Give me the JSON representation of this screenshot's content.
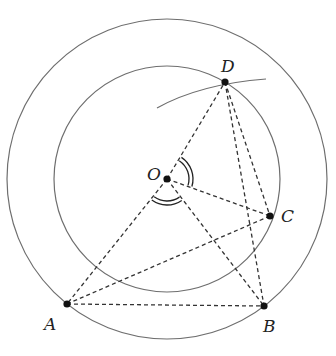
{
  "diagram": {
    "type": "geometry",
    "colors": {
      "circle_stroke": "#6e6e6e",
      "dashed_stroke": "#333333",
      "point_fill": "#111111",
      "label_color": "#222222",
      "background": "#ffffff"
    },
    "center": {
      "label": "O",
      "x": 167,
      "y": 179
    },
    "circles": [
      {
        "name": "outer",
        "cx": 167,
        "cy": 179,
        "r": 160
      },
      {
        "name": "inner",
        "cx": 167,
        "cy": 179,
        "r": 113
      }
    ],
    "points": [
      {
        "label": "O",
        "x": 167,
        "y": 179,
        "label_x": 147,
        "label_y": 180
      },
      {
        "label": "D",
        "x": 225,
        "y": 82,
        "label_x": 221,
        "label_y": 72
      },
      {
        "label": "C",
        "x": 270,
        "y": 216,
        "label_x": 281,
        "label_y": 222
      },
      {
        "label": "A",
        "x": 67,
        "y": 304,
        "label_x": 44,
        "label_y": 330
      },
      {
        "label": "B",
        "x": 264,
        "y": 306,
        "label_x": 263,
        "label_y": 332
      }
    ],
    "dashed_segments": [
      [
        "O",
        "D"
      ],
      [
        "O",
        "C"
      ],
      [
        "O",
        "A"
      ],
      [
        "O",
        "B"
      ],
      [
        "A",
        "B"
      ],
      [
        "A",
        "C"
      ],
      [
        "D",
        "C"
      ],
      [
        "D",
        "B"
      ]
    ],
    "arc_through_D": {
      "from": [
        157,
        108
      ],
      "control": [
        200,
        84
      ],
      "to": [
        266,
        79
      ]
    },
    "angle_marks": [
      {
        "name": "angle-DOC",
        "arcs": 2
      },
      {
        "name": "angle-AOB",
        "arcs": 2
      }
    ]
  }
}
